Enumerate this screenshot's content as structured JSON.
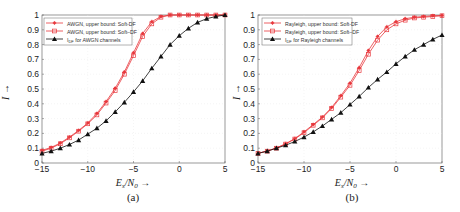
{
  "chart_data": [
    {
      "type": "line",
      "panel": "(a)",
      "title": "",
      "xlabel": "E_s/N_0 →",
      "ylabel": "I →",
      "xlim": [
        -15,
        5
      ],
      "ylim": [
        0,
        1
      ],
      "xticks": [
        -15,
        -10,
        -5,
        0,
        5
      ],
      "yticks": [
        0,
        0.1,
        0.2,
        0.3,
        0.4,
        0.5,
        0.6,
        0.7,
        0.8,
        0.9,
        1
      ],
      "grid": true,
      "legend_position": "upper left",
      "x": [
        -15,
        -14,
        -13,
        -12,
        -11,
        -10,
        -9,
        -8,
        -7,
        -6,
        -5,
        -4,
        -3,
        -2,
        -1,
        0,
        1,
        2,
        3,
        4,
        5
      ],
      "series": [
        {
          "name": "AWGN, upper bound: Soft-DF",
          "color": "#e8383d",
          "marker": "star",
          "values": [
            0.085,
            0.105,
            0.135,
            0.175,
            0.22,
            0.27,
            0.335,
            0.415,
            0.505,
            0.615,
            0.745,
            0.875,
            0.955,
            0.99,
            1.0,
            1.0,
            1.0,
            1.0,
            1.0,
            1.0,
            1.0
          ]
        },
        {
          "name": "AWGN, upper bound: Soft–DF",
          "color": "#e8383d",
          "marker": "square",
          "values": [
            0.08,
            0.1,
            0.13,
            0.17,
            0.215,
            0.265,
            0.325,
            0.405,
            0.49,
            0.6,
            0.725,
            0.855,
            0.94,
            0.985,
            1.0,
            1.0,
            1.0,
            1.0,
            1.0,
            1.0,
            1.0
          ]
        },
        {
          "name": "I_DF for AWGN channels",
          "color": "#111111",
          "marker": "triangle",
          "values": [
            0.065,
            0.08,
            0.1,
            0.125,
            0.155,
            0.195,
            0.235,
            0.285,
            0.345,
            0.41,
            0.48,
            0.555,
            0.64,
            0.72,
            0.8,
            0.86,
            0.91,
            0.95,
            0.975,
            0.99,
            1.0
          ]
        }
      ]
    },
    {
      "type": "line",
      "panel": "(b)",
      "title": "",
      "xlabel": "E_s/N_0 →",
      "ylabel": "I →",
      "xlim": [
        -15,
        5
      ],
      "ylim": [
        0,
        1
      ],
      "xticks": [
        -15,
        -10,
        -5,
        0,
        5
      ],
      "yticks": [
        0,
        0.1,
        0.2,
        0.3,
        0.4,
        0.5,
        0.6,
        0.7,
        0.8,
        0.9,
        1
      ],
      "grid": true,
      "legend_position": "upper left",
      "x": [
        -15,
        -14,
        -13,
        -12,
        -11,
        -10,
        -9,
        -8,
        -7,
        -6,
        -5,
        -4,
        -3,
        -2,
        -1,
        0,
        1,
        2,
        3,
        4,
        5
      ],
      "series": [
        {
          "name": "Rayleigh, upper bound: Soft-DF",
          "color": "#e8383d",
          "marker": "star",
          "values": [
            0.065,
            0.082,
            0.102,
            0.13,
            0.165,
            0.21,
            0.26,
            0.31,
            0.375,
            0.455,
            0.54,
            0.645,
            0.76,
            0.855,
            0.92,
            0.955,
            0.975,
            0.985,
            0.99,
            0.995,
            0.997
          ]
        },
        {
          "name": "Rayleigh, upper bound: Soft–DF",
          "color": "#e8383d",
          "marker": "square",
          "values": [
            0.065,
            0.08,
            0.1,
            0.128,
            0.162,
            0.205,
            0.255,
            0.305,
            0.368,
            0.445,
            0.525,
            0.625,
            0.735,
            0.83,
            0.9,
            0.94,
            0.965,
            0.98,
            0.985,
            0.99,
            0.995
          ]
        },
        {
          "name": "I_DF for Rayleigh channels",
          "color": "#111111",
          "marker": "triangle",
          "values": [
            0.065,
            0.08,
            0.1,
            0.12,
            0.145,
            0.175,
            0.21,
            0.25,
            0.295,
            0.34,
            0.395,
            0.45,
            0.51,
            0.565,
            0.615,
            0.67,
            0.72,
            0.765,
            0.8,
            0.835,
            0.865
          ]
        }
      ]
    }
  ],
  "panels": [
    {
      "caption": "(a)",
      "xlabel_main": "E",
      "xlabel_sub1": "s",
      "xlabel_mid": "/N",
      "xlabel_sub2": "0",
      "xlabel_arrow": " →",
      "ylabel": "I →",
      "legend": [
        {
          "label": "AWGN, upper bound: Soft-DF"
        },
        {
          "label": "AWGN, upper bound: Soft–DF"
        },
        {
          "label_main": "I",
          "label_sub": "DF",
          "label_rest": " for AWGN channels"
        }
      ]
    },
    {
      "caption": "(b)",
      "xlabel_main": "E",
      "xlabel_sub1": "s",
      "xlabel_mid": "/N",
      "xlabel_sub2": "0",
      "xlabel_arrow": " →",
      "ylabel": "I →",
      "legend": [
        {
          "label": "Rayleigh, upper bound: Soft-DF"
        },
        {
          "label": "Rayleigh, upper bound: Soft–DF"
        },
        {
          "label_main": "I",
          "label_sub": "DF",
          "label_rest": " for Rayleigh channels"
        }
      ]
    }
  ]
}
